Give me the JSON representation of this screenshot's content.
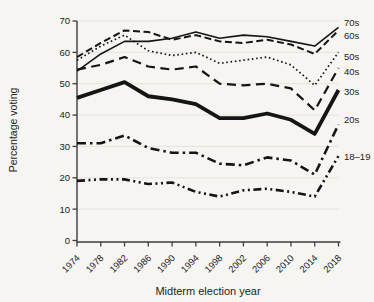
{
  "chart_data": {
    "type": "line",
    "title": "",
    "xlabel": "Midterm election year",
    "ylabel": "Percentage voting",
    "ylim": [
      0,
      70
    ],
    "yticks": [
      0,
      10,
      20,
      30,
      40,
      50,
      60,
      70
    ],
    "grid": "horizontal-light",
    "legend_position": "right-end-labels",
    "x": [
      "1974",
      "1978",
      "1982",
      "1986",
      "1990",
      "1994",
      "1998",
      "2002",
      "2006",
      "2010",
      "2014",
      "2018"
    ],
    "series": [
      {
        "name": "70s",
        "line_style": "solid-thin",
        "values": [
          54,
          59.5,
          63.5,
          63.5,
          64.5,
          66.5,
          64.5,
          65.5,
          65,
          63.5,
          62,
          68
        ]
      },
      {
        "name": "60s",
        "line_style": "dashed",
        "values": [
          58.5,
          63,
          67,
          66.5,
          64,
          65.5,
          63.5,
          63,
          64,
          62.5,
          59.5,
          67
        ]
      },
      {
        "name": "50s",
        "line_style": "dotted",
        "values": [
          57.5,
          62,
          65.5,
          60.5,
          59,
          60,
          56.5,
          57.5,
          58.5,
          56,
          49.5,
          60
        ]
      },
      {
        "name": "40s",
        "line_style": "long-dash",
        "values": [
          54.5,
          56,
          58.5,
          55.5,
          54.5,
          55.5,
          50,
          49.5,
          50,
          48.5,
          41.5,
          55
        ]
      },
      {
        "name": "30s",
        "line_style": "solid-thick",
        "values": [
          45.5,
          48,
          50.5,
          46,
          45,
          43.5,
          39,
          39,
          40.5,
          38.5,
          34,
          48
        ]
      },
      {
        "name": "20s",
        "line_style": "dash-dot",
        "values": [
          31,
          31,
          33.5,
          29.5,
          28,
          28,
          24.5,
          24,
          26.5,
          25.5,
          21,
          37
        ]
      },
      {
        "name": "18–19",
        "line_style": "dash-dot-dot",
        "values": [
          19,
          19.5,
          19.5,
          18,
          18.5,
          15.5,
          14,
          16,
          16.5,
          15.5,
          14,
          27
        ]
      }
    ],
    "ink_color": "#151515",
    "axis_color": "#3d3d3d",
    "grid_color": "#e3e2dd"
  }
}
